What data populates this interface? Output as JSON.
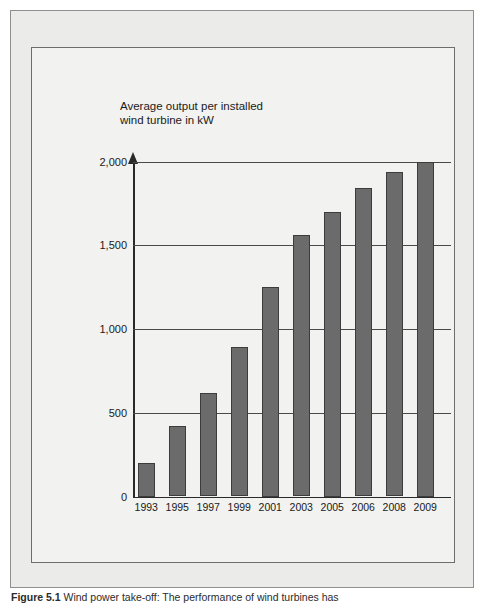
{
  "figure": {
    "caption_label": "Figure 5.1",
    "caption_text": "Wind power take-off: The performance of wind turbines has"
  },
  "chart_data": {
    "type": "bar",
    "title": "Average output per installed\nwind turbine in kW",
    "xlabel": "",
    "ylabel": "",
    "categories": [
      "1993",
      "1995",
      "1997",
      "1999",
      "2001",
      "2003",
      "2005",
      "2006",
      "2008",
      "2009"
    ],
    "values": [
      200,
      420,
      620,
      890,
      1250,
      1560,
      1700,
      1840,
      1940,
      2000
    ],
    "ylim": [
      0,
      2000
    ],
    "yticks": [
      0,
      500,
      1000,
      1500,
      2000
    ],
    "ytick_labels": [
      "0",
      "500",
      "1,000",
      "1,500",
      "2,000"
    ],
    "grid": true,
    "legend": "none",
    "bar_color": "#6b6b6b",
    "bar_edge_color": "#3c3c3c",
    "axis_color": "#2a2a2a",
    "background_color": "#f2f2f0",
    "page_color": "#ebebe9"
  }
}
